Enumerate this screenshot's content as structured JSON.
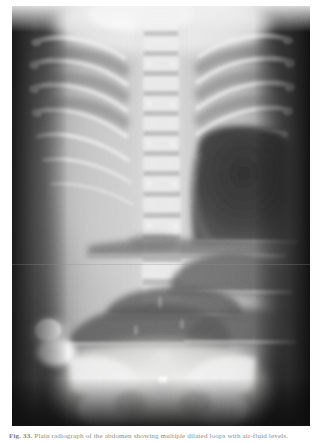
{
  "page": {
    "background_color": "#ffffff",
    "width": 323,
    "height": 442
  },
  "figure": {
    "kind": "radiograph-photograph",
    "modality": "plain-film-radiograph",
    "projection": "antero-posterior supine",
    "plate": {
      "x": 12,
      "y": 6,
      "width": 298,
      "height": 420,
      "border_color": "#1e1e1e",
      "background_color": "#2b2b2b"
    },
    "tone": {
      "darkest": "#141414",
      "dark": "#343434",
      "mid": "#7a7a7a",
      "light": "#c6c6c6",
      "brightest": "#f2f2f2"
    },
    "findings": [
      "bony thorax with symmetric rib cage and visible intercostal spaces",
      "central vertebral column with segmented vertebral bodies",
      "large lucent gas collection in the right upper quadrant with a flat upper border",
      "multiple stacked air-fluid levels across the mid abdomen",
      "rounded dense opacity along the left flank",
      "dense ossified pelvis and iliac wings at the caudal margin",
      "dark unexposed film margins at the lateral borders"
    ]
  },
  "caption": {
    "lead": "Fig. 33.",
    "text": "Plain radiograph of the abdomen showing multiple dilated loops with air-fluid levels.",
    "full": "Fig. 33. Plain radiograph of the abdomen showing multiple dilated loops with air-fluid levels.",
    "color": "#8c8c8c",
    "clipped": true
  }
}
